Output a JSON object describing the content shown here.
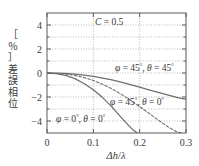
{
  "chart_data": {
    "type": "line",
    "title": "",
    "annotation": "C = 0.5",
    "xlabel": "Δh/λ",
    "ylabel": "位相誤差［％］",
    "xlim": [
      0,
      0.3
    ],
    "ylim": [
      -5,
      5
    ],
    "xticks": [
      0,
      0.1,
      0.2,
      0.3
    ],
    "xtick_labels": [
      "0",
      "0.1",
      "0.2",
      "0.3"
    ],
    "yticks": [
      4,
      2,
      0,
      -2,
      -4
    ],
    "ytick_labels": [
      "4",
      "2",
      "0",
      "−2",
      "−4"
    ],
    "grid": true,
    "legend_position": "inline-annotations",
    "series": [
      {
        "name": "φ = 45°, θ = 45°",
        "style": "solid",
        "color": "#6e6e6e",
        "label_x": 0.165,
        "label_y": 0.55,
        "x": [
          0.0,
          0.02,
          0.04,
          0.06,
          0.08,
          0.1,
          0.12,
          0.14,
          0.16,
          0.18,
          0.2,
          0.22,
          0.24,
          0.26,
          0.28,
          0.3
        ],
        "y": [
          0.0,
          -0.01,
          -0.04,
          -0.1,
          -0.18,
          -0.28,
          -0.42,
          -0.58,
          -0.76,
          -0.97,
          -1.18,
          -1.4,
          -1.62,
          -1.83,
          -2.03,
          -2.2
        ]
      },
      {
        "name": "φ = 45°, θ = 0°",
        "style": "dashed",
        "color": "#6e6e6e",
        "label_x": 0.15,
        "label_y": -2.55,
        "x": [
          0.0,
          0.02,
          0.04,
          0.06,
          0.08,
          0.1,
          0.12,
          0.14,
          0.16,
          0.18,
          0.2,
          0.22,
          0.24,
          0.26,
          0.28,
          0.29
        ],
        "y": [
          0.0,
          -0.02,
          -0.08,
          -0.2,
          -0.38,
          -0.62,
          -0.94,
          -1.32,
          -1.76,
          -2.26,
          -2.8,
          -3.36,
          -3.92,
          -4.46,
          -4.9,
          -5.0
        ]
      },
      {
        "name": "φ = 0°, θ = 0°",
        "style": "solid",
        "color": "#9a9a9a",
        "label_x": 0.012,
        "label_y": -3.95,
        "x": [
          0.0,
          0.02,
          0.04,
          0.06,
          0.08,
          0.1,
          0.12,
          0.14,
          0.16,
          0.175,
          0.185,
          0.195
        ],
        "y": [
          0.0,
          -0.05,
          -0.2,
          -0.47,
          -0.88,
          -1.4,
          -2.05,
          -2.82,
          -3.7,
          -4.32,
          -4.72,
          -5.0
        ]
      }
    ]
  },
  "axes": {
    "x_title": "Δh/λ",
    "y_title_chars": [
      "［",
      "％",
      "］",
      "差",
      "誤",
      "相",
      "位"
    ],
    "x_tick_labels": [
      "0",
      "0.1",
      "0.2",
      "0.3"
    ],
    "y_tick_labels": [
      "4",
      "2",
      "0",
      "−2",
      "−4"
    ]
  },
  "annotations": {
    "constant": "C = 0.5",
    "curve_1": "φ = 45°, θ = 45°",
    "curve_2": "φ = 45°, θ = 0°",
    "curve_3": "φ = 0°, θ = 0°"
  }
}
